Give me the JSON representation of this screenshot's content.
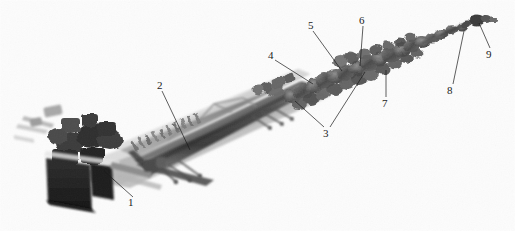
{
  "figure": {
    "kind": "photograph",
    "background_color": "#fdfdfd",
    "ink_color": "#1a1a1a",
    "width": 515,
    "height": 231
  },
  "callouts": [
    {
      "id": "1",
      "label": "1",
      "x": 131,
      "y": 202,
      "anchor_x": 104,
      "anchor_y": 171
    },
    {
      "id": "2",
      "label": "2",
      "x": 159,
      "y": 85,
      "anchor_x": 190,
      "anchor_y": 150
    },
    {
      "id": "3",
      "label": "3",
      "x": 324,
      "y": 130,
      "anchor_x": 295,
      "anchor_y": 101
    },
    {
      "id": "3b",
      "label": "",
      "x": 324,
      "y": 130,
      "anchor_x": 365,
      "anchor_y": 72
    },
    {
      "id": "4",
      "label": "4",
      "x": 271,
      "y": 54,
      "anchor_x": 313,
      "anchor_y": 84
    },
    {
      "id": "5",
      "label": "5",
      "x": 310,
      "y": 24,
      "anchor_x": 342,
      "anchor_y": 71
    },
    {
      "id": "6",
      "label": "6",
      "x": 361,
      "y": 19,
      "anchor_x": 359,
      "anchor_y": 66
    },
    {
      "id": "7",
      "label": "7",
      "x": 385,
      "y": 101,
      "anchor_x": 385,
      "anchor_y": 70
    },
    {
      "id": "8",
      "label": "8",
      "x": 450,
      "y": 88,
      "anchor_x": 464,
      "anchor_y": 31
    },
    {
      "id": "9",
      "label": "9",
      "x": 489,
      "y": 53,
      "anchor_x": 479,
      "anchor_y": 22
    }
  ]
}
